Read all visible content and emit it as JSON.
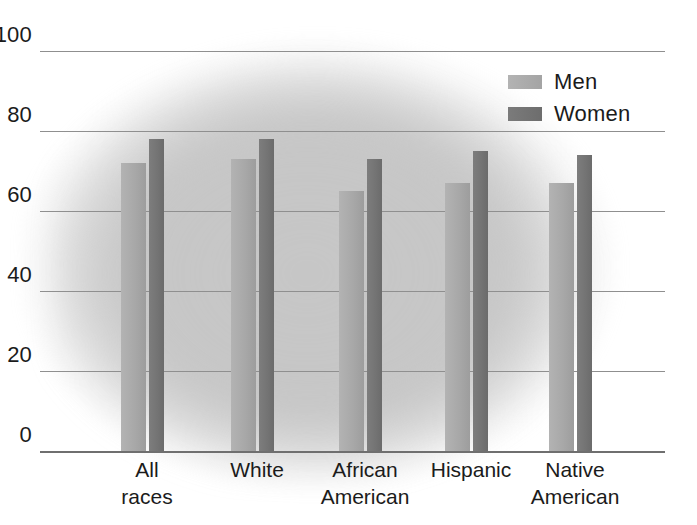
{
  "chart_data": {
    "type": "bar",
    "title": "",
    "subtitle": "",
    "xlabel": "",
    "ylabel": "",
    "ylim": [
      0,
      100
    ],
    "yticks": [
      0,
      20,
      40,
      60,
      80,
      100
    ],
    "grid": true,
    "legend_position": "top-right",
    "categories": [
      "All\nraces",
      "White",
      "African\nAmerican",
      "Hispanic",
      "Native\nAmerican"
    ],
    "series": [
      {
        "name": "Men",
        "color": "#a8a8a8",
        "values": [
          72,
          73,
          65,
          67,
          67
        ]
      },
      {
        "name": "Women",
        "color": "#747474",
        "values": [
          78,
          78,
          73,
          75,
          74
        ]
      }
    ]
  },
  "axis": {
    "ticks": [
      {
        "label": "100",
        "value": 100
      },
      {
        "label": "80",
        "value": 80
      },
      {
        "label": "60",
        "value": 60
      },
      {
        "label": "40",
        "value": 40
      },
      {
        "label": "20",
        "value": 20
      },
      {
        "label": "0",
        "value": 0
      }
    ]
  },
  "legend": {
    "items": [
      {
        "label": "Men",
        "key": "men"
      },
      {
        "label": "Women",
        "key": "women"
      }
    ]
  },
  "colors": {
    "men_bar": "#a8a8a8",
    "women_bar": "#747474",
    "gridline": "#8f8f8f",
    "baseline": "#6f6f6f",
    "text": "#1b1b1b",
    "background_blob": "#c9c9c9"
  }
}
